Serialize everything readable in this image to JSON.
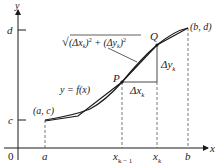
{
  "diagram": {
    "type": "arc-length-approximation",
    "axes": {
      "x_label": "x",
      "y_label": "y",
      "origin_label": "0"
    },
    "x_ticks": [
      {
        "id": "a",
        "label": "a"
      },
      {
        "id": "xkm1",
        "label": "x",
        "sub": "k − 1"
      },
      {
        "id": "xk",
        "label": "x",
        "sub": "k"
      },
      {
        "id": "b",
        "label": "b"
      }
    ],
    "y_ticks": [
      {
        "id": "c",
        "label": "c"
      },
      {
        "id": "d",
        "label": "d"
      }
    ],
    "points": {
      "start": "(a, c)",
      "end": "(b, d)",
      "P": "P",
      "Q": "Q"
    },
    "curve_label": "y = f(x)",
    "segment_formula": {
      "prefix": "√",
      "body_1": "(Δx",
      "sub_1": "k",
      "body_2": ")",
      "sup_1": "2",
      "plus": " + (Δy",
      "sub_2": "k",
      "body_3": ")",
      "sup_2": "2"
    },
    "delta_x": {
      "label": "Δx",
      "sub": "k"
    },
    "delta_y": {
      "label": "Δy",
      "sub": "k"
    },
    "colors": {
      "stroke": "#1a1a1a",
      "dashed": "#555555",
      "background": "#ffffff"
    }
  }
}
